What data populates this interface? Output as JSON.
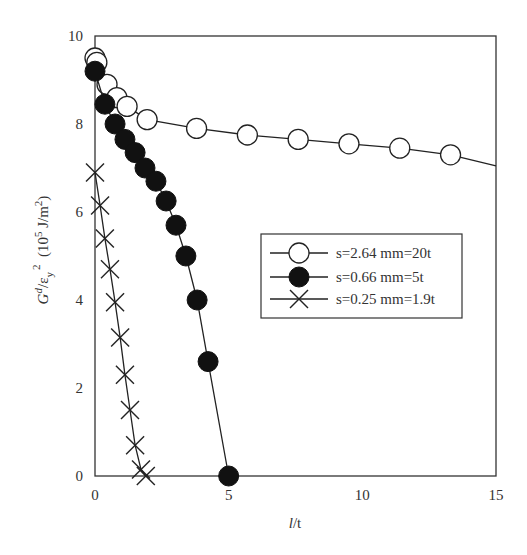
{
  "chart_data": {
    "type": "line",
    "title": "",
    "xlabel": "l/t",
    "ylabel": "G^d/ε_y^2 (10^5 J/m^2)",
    "xlim": [
      0,
      15
    ],
    "ylim": [
      0,
      10
    ],
    "x_ticks": [
      0,
      5,
      10,
      15
    ],
    "y_ticks": [
      0,
      2,
      4,
      6,
      8,
      10
    ],
    "grid": false,
    "legend_position": "center-right inside plot",
    "series": [
      {
        "name": "s=2.64 mm=20t",
        "marker": "open-circle",
        "x": [
          0,
          0.07,
          0.45,
          0.82,
          1.2,
          1.95,
          3.8,
          5.7,
          7.6,
          9.5,
          11.4,
          13.3
        ],
        "y": [
          9.5,
          9.4,
          8.9,
          8.6,
          8.4,
          8.1,
          7.9,
          7.75,
          7.65,
          7.55,
          7.45,
          7.3
        ],
        "line_extends_to": {
          "x": 15,
          "y": 7.05
        }
      },
      {
        "name": "s=0.66 mm=5t",
        "marker": "filled-circle",
        "x": [
          0,
          0.37,
          0.75,
          1.12,
          1.5,
          1.87,
          2.28,
          2.66,
          3.03,
          3.4,
          3.82,
          4.23,
          5.0
        ],
        "y": [
          9.2,
          8.45,
          8.0,
          7.65,
          7.35,
          7.0,
          6.7,
          6.25,
          5.7,
          5.0,
          4.0,
          2.6,
          0
        ]
      },
      {
        "name": "s=0.25 mm=1.9t",
        "marker": "x-cross",
        "x": [
          0,
          0.19,
          0.37,
          0.56,
          0.75,
          0.94,
          1.12,
          1.31,
          1.5,
          1.72,
          1.9
        ],
        "y": [
          6.9,
          6.15,
          5.4,
          4.7,
          3.95,
          3.15,
          2.3,
          1.5,
          0.7,
          0.15,
          0
        ]
      }
    ]
  },
  "axes": {
    "x_label_main": "l",
    "x_label_rest": "/t",
    "y_label_G": "G",
    "y_label_d": "d",
    "y_label_eps": "/ε",
    "y_label_y": "y",
    "y_label_2": "2",
    "y_label_units_open": "  (10",
    "y_label_5": "5",
    "y_label_units_mid": " J/m",
    "y_label_units_2": "2",
    "y_label_close": ")"
  }
}
